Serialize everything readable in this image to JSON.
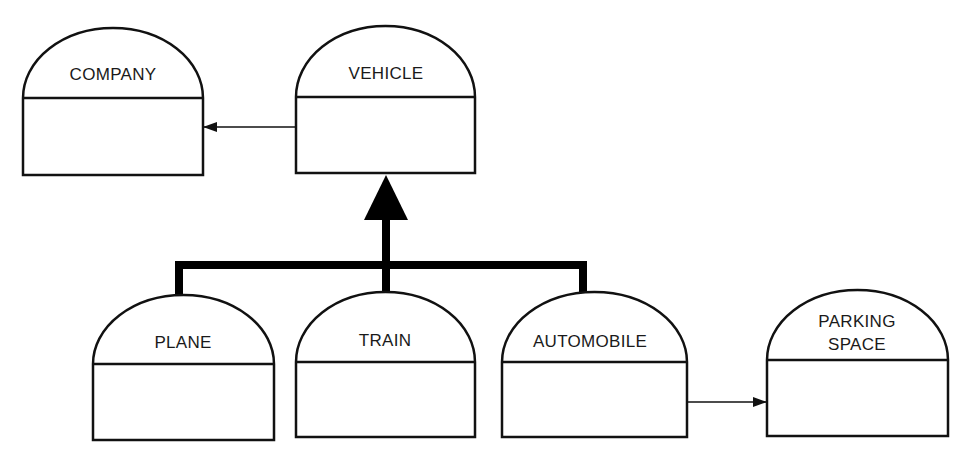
{
  "diagram": {
    "type": "object-class-hierarchy",
    "classes": [
      {
        "id": "company",
        "label": "COMPANY"
      },
      {
        "id": "vehicle",
        "label": "VEHICLE"
      },
      {
        "id": "plane",
        "label": "PLANE"
      },
      {
        "id": "train",
        "label": "TRAIN"
      },
      {
        "id": "automobile",
        "label": "AUTOMOBILE"
      },
      {
        "id": "parking_space",
        "label_line1": "PARKING",
        "label_line2": "SPACE"
      }
    ],
    "relations": [
      {
        "type": "association",
        "from": "VEHICLE",
        "to": "COMPANY"
      },
      {
        "type": "inheritance",
        "children": [
          "PLANE",
          "TRAIN",
          "AUTOMOBILE"
        ],
        "parent": "VEHICLE"
      },
      {
        "type": "association",
        "from": "AUTOMOBILE",
        "to": "PARKING SPACE"
      }
    ],
    "colors": {
      "stroke": "#111111",
      "background": "#ffffff"
    }
  }
}
